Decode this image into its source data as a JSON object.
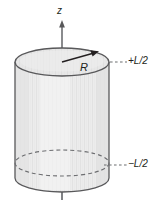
{
  "figure": {
    "name": "uniformly-charged-cylinder-with-z-axis",
    "background_color": "#ffffff",
    "width": 165,
    "height": 201
  },
  "axis": {
    "label": "z",
    "direction": "up",
    "icon": "arrow-up-icon",
    "color": "#6d6e71",
    "x": 62,
    "arrow_tip_y": 22,
    "bottom_y": 199
  },
  "cylinder": {
    "name": "cylinder-body",
    "fill_color": "#ebebeb",
    "stroke_color": "#58585a",
    "stripe_color": "#e0e0e0",
    "left_x": 15,
    "right_x": 109,
    "top_center_y": 62,
    "bottom_center_y": 178,
    "ellipse_rx": 47,
    "ellipse_ry": 14
  },
  "top_face": {
    "name": "cylinder-top-ellipse",
    "fill_color": "#e6e6e6",
    "stroke_color": "#58585a"
  },
  "hidden_edge": {
    "name": "cylinder-hidden-bottom-ellipse",
    "style": "dashed",
    "stroke_color": "#6d6e71",
    "center_y": 163
  },
  "radius": {
    "label": "R",
    "icon": "arrow-up-right-icon",
    "stroke_color": "#231f20",
    "from_x": 62,
    "from_y": 62,
    "to_x": 96,
    "to_y": 53
  },
  "annotations": [
    {
      "name": "top-level-marker",
      "label": "+L/2",
      "leader_style": "dashed",
      "leader_color": "#6d6e71",
      "leader_from_x": 110,
      "leader_to_x": 127,
      "leader_y": 62
    },
    {
      "name": "bottom-level-marker",
      "label": "−L/2",
      "leader_style": "dashed",
      "leader_color": "#6d6e71",
      "leader_from_x": 104,
      "leader_to_x": 127,
      "leader_y": 165
    }
  ]
}
